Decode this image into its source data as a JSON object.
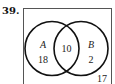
{
  "problem_number": "39.",
  "venn": {
    "sets": [
      {
        "label": "A",
        "only_count": "18"
      },
      {
        "label": "B",
        "only_count": "2"
      }
    ],
    "intersection": "10",
    "outside": "17"
  }
}
